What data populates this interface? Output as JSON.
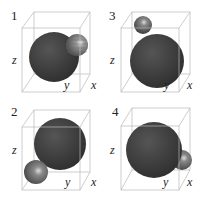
{
  "figure": {
    "panels": [
      {
        "id": "1",
        "label": "1",
        "axes": {
          "x": "x",
          "y": "y",
          "z": "z"
        },
        "small_sphere_position": "upper right, overlapping big sphere (striped)"
      },
      {
        "id": "3",
        "label": "3",
        "axes": {
          "x": "x",
          "y": "y",
          "z": "z"
        },
        "small_sphere_position": "upper left, touching top of big sphere"
      },
      {
        "id": "2",
        "label": "2",
        "axes": {
          "x": "x",
          "y": "y",
          "z": "z"
        },
        "small_sphere_position": "lower left, touching big sphere"
      },
      {
        "id": "4",
        "label": "4",
        "axes": {
          "x": "x",
          "y": "y",
          "z": "z"
        },
        "small_sphere_position": "lower right, touching big sphere"
      }
    ],
    "colors": {
      "big_sphere": "#3a3a3a",
      "small_sphere": "#7a7a7a",
      "box": "#b0b0b0",
      "text": "#222222"
    }
  }
}
